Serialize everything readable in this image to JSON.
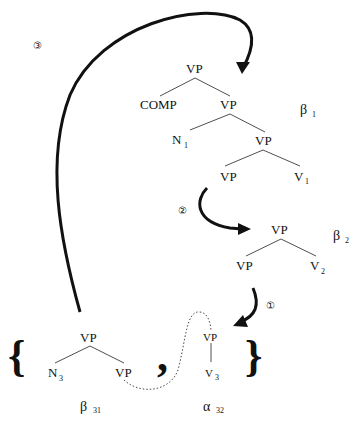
{
  "diagram": {
    "type": "tree-adjoining derivation",
    "trees": {
      "beta1": {
        "label": "β",
        "subscript": "1",
        "nodes": [
          {
            "id": "b1_root",
            "label": "VP"
          },
          {
            "id": "b1_comp",
            "label": "COMP"
          },
          {
            "id": "b1_vp2",
            "label": "VP"
          },
          {
            "id": "b1_n1",
            "label": "N",
            "subscript": "1"
          },
          {
            "id": "b1_vp3",
            "label": "VP"
          },
          {
            "id": "b1_vp4",
            "label": "VP"
          },
          {
            "id": "b1_v1",
            "label": "V",
            "subscript": "1"
          }
        ]
      },
      "beta2": {
        "label": "β",
        "subscript": "2",
        "nodes": [
          {
            "id": "b2_root",
            "label": "VP"
          },
          {
            "id": "b2_vp",
            "label": "VP"
          },
          {
            "id": "b2_v2",
            "label": "V",
            "subscript": "2"
          }
        ]
      },
      "beta31": {
        "label": "β",
        "subscript": "31",
        "nodes": [
          {
            "id": "b31_root",
            "label": "VP"
          },
          {
            "id": "b31_n3",
            "label": "N",
            "subscript": "3"
          },
          {
            "id": "b31_vp",
            "label": "VP"
          }
        ]
      },
      "alpha32": {
        "label": "α",
        "subscript": "32",
        "nodes": [
          {
            "id": "a32_root",
            "label": "VP"
          },
          {
            "id": "a32_v3",
            "label": "V",
            "subscript": "3"
          }
        ]
      }
    },
    "set": {
      "open": "{",
      "separator": ",",
      "close": "}"
    },
    "arrows": [
      {
        "step": "①",
        "from": "beta2",
        "to": "alpha32"
      },
      {
        "step": "②",
        "from": "beta1",
        "to": "beta2"
      },
      {
        "step": "③",
        "from": "beta31",
        "to": "beta1"
      }
    ],
    "dotted_link": {
      "from": "beta31 VP foot",
      "to": "alpha32"
    }
  }
}
